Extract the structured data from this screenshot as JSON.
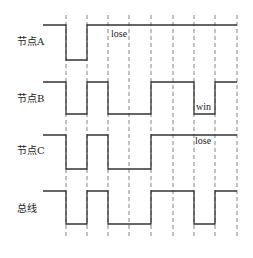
{
  "diagram": {
    "type": "timing-diagram",
    "colors": {
      "signal": "#333333",
      "grid": "#777777",
      "text": "#222222",
      "background": "#ffffff"
    },
    "time_marks_x": [
      66,
      87,
      108,
      129,
      151,
      173,
      194,
      215,
      237
    ],
    "start_x": 43,
    "grid_y": [
      15,
      238
    ],
    "rows": [
      {
        "id": "node-a",
        "label": "节点A",
        "label_pos": [
          17,
          45
        ],
        "high_y": 25,
        "low_y": 60,
        "levels": [
          "H",
          "L",
          "H",
          "H",
          "H",
          "H",
          "H",
          "H",
          "H"
        ],
        "annotations": [
          {
            "text": "lose",
            "x": 111,
            "y": 37
          }
        ]
      },
      {
        "id": "node-b",
        "label": "节点B",
        "label_pos": [
          17,
          102
        ],
        "high_y": 82,
        "low_y": 114,
        "levels": [
          "H",
          "L",
          "H",
          "L",
          "L",
          "H",
          "H",
          "L",
          "H"
        ],
        "annotations": [
          {
            "text": "win",
            "x": 196,
            "y": 110
          }
        ]
      },
      {
        "id": "node-c",
        "label": "节点C",
        "label_pos": [
          17,
          154
        ],
        "high_y": 135,
        "low_y": 169,
        "levels": [
          "H",
          "L",
          "H",
          "L",
          "L",
          "H",
          "H",
          "H",
          "H"
        ],
        "annotations": [
          {
            "text": "lose",
            "x": 195,
            "y": 144
          }
        ]
      },
      {
        "id": "bus",
        "label": "总线",
        "label_pos": [
          17,
          212
        ],
        "high_y": 191,
        "low_y": 224,
        "levels": [
          "H",
          "L",
          "H",
          "L",
          "L",
          "H",
          "H",
          "L",
          "H"
        ],
        "annotations": []
      }
    ]
  }
}
